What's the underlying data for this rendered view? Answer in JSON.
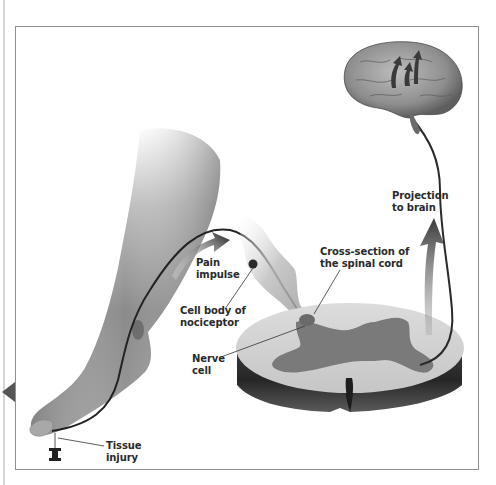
{
  "figure": {
    "type": "anatomical-diagram",
    "frame_color": "#8f8f8f",
    "labels": {
      "tissue_injury": [
        "Tissue",
        "injury"
      ],
      "pain_impulse": [
        "Pain",
        "impulse"
      ],
      "cell_body": [
        "Cell body of",
        "nociceptor"
      ],
      "nerve_cell": [
        "Nerve",
        "cell"
      ],
      "cross_section": [
        "Cross-section of",
        "the spinal cord"
      ],
      "projection": [
        "Projection",
        "to brain"
      ]
    }
  }
}
